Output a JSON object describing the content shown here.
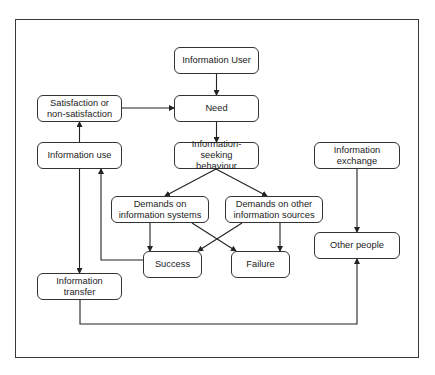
{
  "diagram": {
    "title": "",
    "nodes": [
      {
        "id": "information_user",
        "label": "Information User",
        "x": 174,
        "y": 47,
        "w": 85,
        "h": 27
      },
      {
        "id": "need",
        "label": "Need",
        "x": 174,
        "y": 95,
        "w": 85,
        "h": 27
      },
      {
        "id": "satisfaction",
        "label": "Satisfaction or\nnon-satisfaction",
        "x": 37,
        "y": 95,
        "w": 85,
        "h": 27
      },
      {
        "id": "information_use",
        "label": "Information use",
        "x": 37,
        "y": 142,
        "w": 85,
        "h": 27
      },
      {
        "id": "information_seeking",
        "label": "Information-seeking\nbehaviour",
        "x": 174,
        "y": 142,
        "w": 85,
        "h": 27
      },
      {
        "id": "information_exchange",
        "label": "Information\nexchange",
        "x": 314,
        "y": 142,
        "w": 86,
        "h": 27
      },
      {
        "id": "demands_systems",
        "label": "Demands on\ninformation systems",
        "x": 111,
        "y": 196,
        "w": 98,
        "h": 27
      },
      {
        "id": "demands_other",
        "label": "Demands on other\ninformation sources",
        "x": 225,
        "y": 196,
        "w": 98,
        "h": 27
      },
      {
        "id": "other_people",
        "label": "Other people",
        "x": 314,
        "y": 232,
        "w": 86,
        "h": 27
      },
      {
        "id": "success",
        "label": "Success",
        "x": 143,
        "y": 251,
        "w": 59,
        "h": 27
      },
      {
        "id": "failure",
        "label": "Failure",
        "x": 231,
        "y": 251,
        "w": 59,
        "h": 27
      },
      {
        "id": "information_transfer",
        "label": "Information transfer",
        "x": 37,
        "y": 273,
        "w": 85,
        "h": 27
      }
    ],
    "edges": [
      {
        "from": "information_user",
        "to": "need"
      },
      {
        "from": "satisfaction",
        "to": "need"
      },
      {
        "from": "need",
        "to": "information_seeking"
      },
      {
        "from": "information_use",
        "to": "satisfaction"
      },
      {
        "from": "information_seeking",
        "to": "demands_systems"
      },
      {
        "from": "information_seeking",
        "to": "demands_other"
      },
      {
        "from": "demands_systems",
        "to": "success"
      },
      {
        "from": "demands_systems",
        "to": "failure"
      },
      {
        "from": "demands_other",
        "to": "success"
      },
      {
        "from": "demands_other",
        "to": "failure"
      },
      {
        "from": "success",
        "to": "information_use"
      },
      {
        "from": "information_use",
        "to": "information_transfer"
      },
      {
        "from": "information_transfer",
        "to": "other_people"
      },
      {
        "from": "information_exchange",
        "to": "other_people"
      }
    ]
  }
}
